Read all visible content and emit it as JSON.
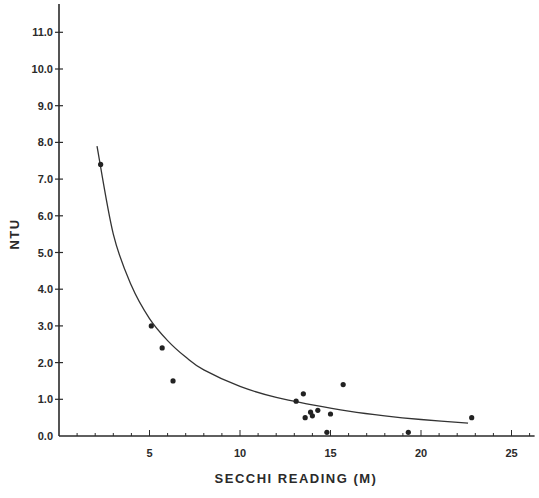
{
  "chart_data": {
    "type": "scatter",
    "title": "",
    "xlabel": "SECCHI READING (M)",
    "ylabel": "NTU",
    "xlim": [
      0,
      26
    ],
    "ylim": [
      0,
      11.5
    ],
    "x_ticks": [
      5,
      10,
      15,
      20,
      25
    ],
    "x_tick_labels": [
      "5",
      "10",
      "15",
      "20",
      "25"
    ],
    "y_ticks": [
      0,
      1,
      2,
      3,
      4,
      5,
      6,
      7,
      8,
      9,
      10,
      11
    ],
    "y_tick_labels": [
      "0.0",
      "1.0",
      "2.0",
      "3.0",
      "4.0",
      "5.0",
      "6.0",
      "7.0",
      "8.0",
      "9.0",
      "10.0",
      "11.0"
    ],
    "grid": false,
    "legend": null,
    "series": [
      {
        "name": "observations",
        "type": "scatter",
        "points": [
          {
            "x": 2.3,
            "y": 7.4
          },
          {
            "x": 5.1,
            "y": 3.0
          },
          {
            "x": 5.7,
            "y": 2.4
          },
          {
            "x": 6.3,
            "y": 1.5
          },
          {
            "x": 13.1,
            "y": 0.95
          },
          {
            "x": 13.5,
            "y": 1.15
          },
          {
            "x": 13.6,
            "y": 0.5
          },
          {
            "x": 13.9,
            "y": 0.65
          },
          {
            "x": 14.0,
            "y": 0.55
          },
          {
            "x": 14.3,
            "y": 0.7
          },
          {
            "x": 14.8,
            "y": 0.1
          },
          {
            "x": 15.0,
            "y": 0.6
          },
          {
            "x": 15.7,
            "y": 1.4
          },
          {
            "x": 19.3,
            "y": 0.1
          },
          {
            "x": 22.8,
            "y": 0.5
          }
        ]
      },
      {
        "name": "fitted curve",
        "type": "line",
        "points": [
          {
            "x": 2.1,
            "y": 7.9
          },
          {
            "x": 3.0,
            "y": 5.5
          },
          {
            "x": 4.0,
            "y": 4.1
          },
          {
            "x": 5.0,
            "y": 3.2
          },
          {
            "x": 6.0,
            "y": 2.6
          },
          {
            "x": 7.0,
            "y": 2.15
          },
          {
            "x": 8.0,
            "y": 1.8
          },
          {
            "x": 10.0,
            "y": 1.35
          },
          {
            "x": 12.0,
            "y": 1.05
          },
          {
            "x": 14.0,
            "y": 0.85
          },
          {
            "x": 16.0,
            "y": 0.68
          },
          {
            "x": 18.0,
            "y": 0.55
          },
          {
            "x": 20.0,
            "y": 0.45
          },
          {
            "x": 22.6,
            "y": 0.35
          }
        ]
      }
    ]
  },
  "axes": {
    "x_title": "SECCHI READING (M)",
    "y_title": "NTU"
  }
}
